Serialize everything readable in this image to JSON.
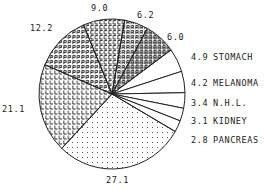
{
  "chart_data": {
    "type": "pie",
    "title": "",
    "slices": [
      {
        "label": "STOMACH",
        "value": 4.9,
        "fill": "blank",
        "start_deg": 36,
        "end_deg": 17.6
      },
      {
        "label": "MELANOMA",
        "value": 4.2,
        "fill": "blank",
        "start_deg": 17.6,
        "end_deg": 1
      },
      {
        "label": "N.H.L.",
        "value": 3.4,
        "fill": "blank",
        "start_deg": 1,
        "end_deg": -11
      },
      {
        "label": "KIDNEY",
        "value": 3.1,
        "fill": "blank",
        "start_deg": -11,
        "end_deg": -21
      },
      {
        "label": "PANCREAS",
        "value": 2.8,
        "fill": "blank",
        "start_deg": -21,
        "end_deg": -30
      },
      {
        "label": "",
        "value": 27.1,
        "fill": "dots",
        "start_deg": -30,
        "end_deg": -133.5
      },
      {
        "label": "",
        "value": 21.1,
        "fill": "letter-L",
        "start_deg": -133.5,
        "end_deg": -203
      },
      {
        "label": "",
        "value": 12.2,
        "fill": "letter-P",
        "start_deg": 157,
        "end_deg": 113
      },
      {
        "label": "",
        "value": 9.0,
        "fill": "letter-C",
        "start_deg": 113,
        "end_deg": 80
      },
      {
        "label": "",
        "value": 6.2,
        "fill": "letter-R",
        "start_deg": 80,
        "end_deg": 61
      },
      {
        "label": "",
        "value": 6.0,
        "fill": "letter-B",
        "start_deg": 61,
        "end_deg": 36
      }
    ],
    "values": [
      4.9,
      4.2,
      3.4,
      3.1,
      2.8,
      27.1,
      21.1,
      12.2,
      9.0,
      6.2,
      6.0
    ],
    "categories": [
      "STOMACH",
      "MELANOMA",
      "N.H.L.",
      "KIDNEY",
      "PANCREAS",
      "",
      "",
      "",
      "",
      "",
      ""
    ],
    "legend_position": "right",
    "grid": false
  },
  "labels": {
    "v9_0": "9.0",
    "v6_2": "6.2",
    "v12_2": "12.2",
    "v6_0": "6.0",
    "v21_1": "21.1",
    "v27_1": "27.1"
  },
  "legend": [
    {
      "value": "4.9",
      "name": "STOMACH"
    },
    {
      "value": "4.2",
      "name": "MELANOMA"
    },
    {
      "value": "3.4",
      "name": "N.H.L."
    },
    {
      "value": "3.1",
      "name": "KIDNEY"
    },
    {
      "value": "2.8",
      "name": "PANCREAS"
    }
  ]
}
